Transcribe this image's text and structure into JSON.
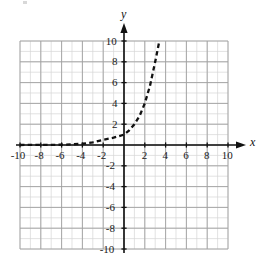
{
  "figure": {
    "kind": "cartesian-coordinate-plane",
    "background": "#ffffff",
    "axis_color": "#111111",
    "minor_grid_color": "#d6d6d6",
    "major_grid_color": "#a0a0a0",
    "curve_color": "#111111",
    "curve_style": "dashed"
  },
  "axes": {
    "x_label": "x",
    "y_label": "y",
    "x_ticks": [
      "-10",
      "-8",
      "-6",
      "-4",
      "-2",
      "2",
      "4",
      "6",
      "8",
      "10"
    ],
    "y_ticks": [
      "10",
      "8",
      "6",
      "4",
      "2",
      "-2",
      "-4",
      "-6",
      "-8",
      "-10"
    ]
  },
  "chart_data": {
    "type": "line",
    "title": "",
    "xlabel": "x",
    "ylabel": "y",
    "xlim": [
      -10,
      10
    ],
    "ylim": [
      -10,
      10
    ],
    "grid": true,
    "grid_minor_step": 1,
    "grid_major_step": 2,
    "legend": null,
    "series": [
      {
        "name": "exponential growth curve",
        "style": "dashed",
        "color": "#111111",
        "x": [
          -10,
          -9,
          -8,
          -7,
          -6,
          -5,
          -4,
          -3,
          -2,
          -1,
          0,
          0.5,
          1,
          1.5,
          2,
          2.5,
          3,
          3.4
        ],
        "y": [
          0.002,
          0.004,
          0.008,
          0.015,
          0.03,
          0.06,
          0.12,
          0.25,
          0.5,
          0.7,
          1,
          1.4,
          2,
          2.8,
          4,
          5.7,
          8,
          10
        ],
        "annotations": [
          "horizontal asymptote at y = 0",
          "passes through (0, 1)",
          "exits top of grid near x = 3.4"
        ]
      }
    ]
  }
}
